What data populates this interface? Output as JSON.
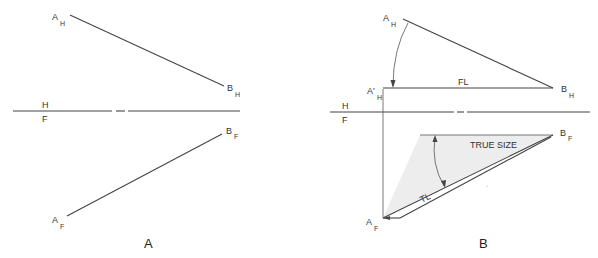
{
  "panels": [
    {
      "caption": "A",
      "labels": {
        "a_h": "A",
        "a_h_sub": "H",
        "b_h": "B",
        "b_h_sub": "H",
        "a_f": "A",
        "a_f_sub": "F",
        "b_f": "B",
        "b_f_sub": "F",
        "fold_top": "H",
        "fold_bottom": "F"
      }
    },
    {
      "caption": "B",
      "labels": {
        "a_h": "A",
        "a_h_sub": "H",
        "a_prime_h": "A'",
        "a_prime_h_sub": "H",
        "b_h": "B",
        "b_h_sub": "H",
        "a_f": "A",
        "a_f_sub": "F",
        "b_f": "B",
        "b_f_sub": "F",
        "fold_top": "H",
        "fold_bottom": "F",
        "frontal_line": "FL",
        "true_length": "TL",
        "true_size": "TRUE SIZE"
      }
    }
  ],
  "colors": {
    "line": "#444444",
    "shade": "#eeeeee"
  }
}
